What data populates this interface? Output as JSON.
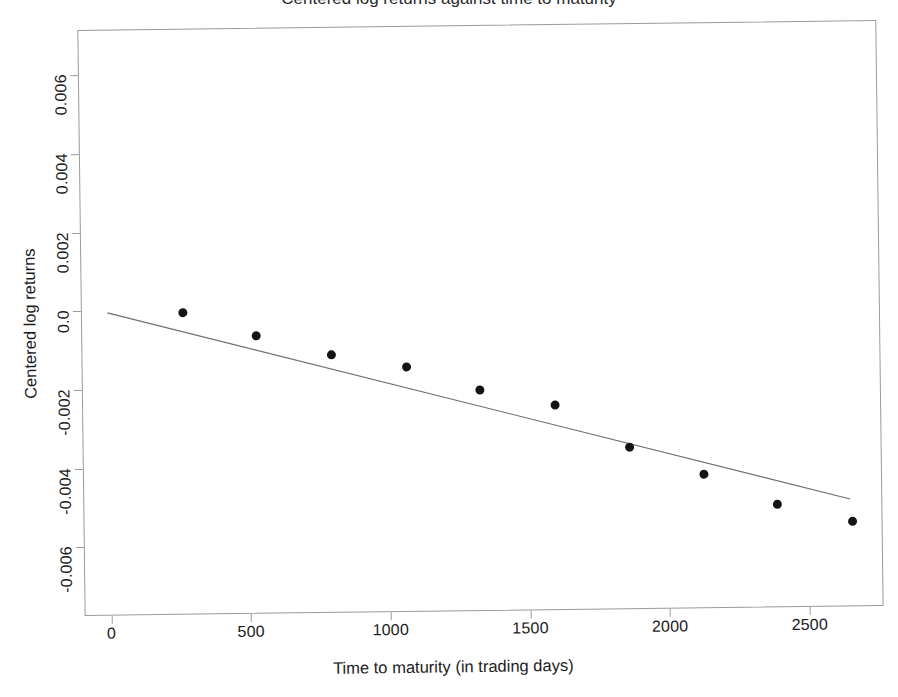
{
  "figure": {
    "background_color": "#ffffff",
    "frame_color": "#9b9b9b",
    "point_color": "#141414",
    "line_color": "#6e6e6e",
    "cut_title": "Centered log returns against time to maturity"
  },
  "chart_data": {
    "type": "scatter",
    "title": "",
    "xlabel": "Time to maturity (in trading days)",
    "ylabel": "Centered log returns",
    "xlim": [
      -95,
      2765
    ],
    "ylim": [
      -0.00775,
      0.00715
    ],
    "xticks": [
      0,
      500,
      1000,
      1500,
      2000,
      2500
    ],
    "xticklabels": [
      "0",
      "500",
      "1000",
      "1500",
      "2000",
      "2500"
    ],
    "yticks": [
      0.006,
      0.004,
      0.002,
      0.0,
      -0.002,
      -0.004,
      -0.006
    ],
    "yticklabels": [
      "0.006",
      "0.004",
      "0.002",
      "0.0",
      "-0.002",
      "-0.004",
      "-0.006"
    ],
    "grid": false,
    "legend": null,
    "series": [
      {
        "name": "Centered log returns",
        "type": "scatter",
        "marker": "filled-circle",
        "x": [
          269,
          533,
          800,
          1068,
          1329,
          1598,
          1863,
          2128,
          2390,
          2659
        ],
        "y": [
          -8e-05,
          -0.00068,
          -0.00118,
          -0.00153,
          -0.00213,
          -0.00255,
          -0.00363,
          -0.00434,
          -0.00513,
          -0.00558
        ]
      },
      {
        "name": "Fitted regression line",
        "type": "line",
        "x": [
          0,
          2650
        ],
        "y": [
          -5e-05,
          -0.00502
        ],
        "slope": -1.87e-06,
        "intercept": -5e-05
      }
    ]
  }
}
